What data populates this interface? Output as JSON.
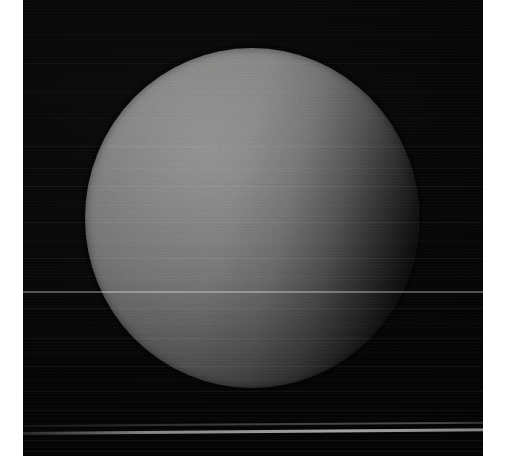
{
  "page": {
    "background_color": "#ffffff",
    "width": 506,
    "height": 476
  },
  "image": {
    "name": "planet-photograph",
    "alt_text": "Grayscale telescope photograph of a featureless planetary disk",
    "plate": {
      "left": 23,
      "top": 0,
      "width": 460,
      "height": 456,
      "background_color": "#050505"
    },
    "margins": {
      "left_px": 23,
      "right_px": 23,
      "top_px": 0,
      "bottom_px": 20,
      "color": "#ffffff"
    }
  },
  "subject": {
    "type": "planetary-disk",
    "description": "Large bright gray sphere, limb-darkened, illuminated from the upper left with the terminator falling off toward the right edge",
    "disk": {
      "center_x": 252,
      "center_y": 218,
      "diameter_px": 338,
      "bounds": {
        "left": 85,
        "top": 48,
        "right": 419,
        "bottom": 388
      }
    },
    "colors": {
      "highlight": "#9a9a99",
      "midtone": "#8a8a89",
      "limb": "#5a5a5b",
      "terminator": "#2a2a2b",
      "sky": "#050505",
      "streak_highlight": "#ffffff"
    }
  },
  "artifacts": {
    "description": "Horizontal detector scan lines and readout streaks across the dark sky",
    "scan_streaks": [
      {
        "top": 12,
        "height": 1,
        "intensity": "dim"
      },
      {
        "top": 34,
        "height": 1,
        "intensity": "dim"
      },
      {
        "top": 63,
        "height": 1,
        "intensity": "dim"
      },
      {
        "top": 92,
        "height": 1,
        "intensity": "dim"
      },
      {
        "top": 118,
        "height": 1,
        "intensity": "dim"
      },
      {
        "top": 146,
        "height": 1,
        "intensity": "normal"
      },
      {
        "top": 168,
        "height": 1,
        "intensity": "dim"
      },
      {
        "top": 186,
        "height": 1,
        "intensity": "normal"
      },
      {
        "top": 205,
        "height": 1,
        "intensity": "dim"
      },
      {
        "top": 222,
        "height": 1,
        "intensity": "normal"
      },
      {
        "top": 241,
        "height": 1,
        "intensity": "dim"
      },
      {
        "top": 258,
        "height": 1,
        "intensity": "normal"
      },
      {
        "top": 276,
        "height": 1,
        "intensity": "dim"
      },
      {
        "top": 291,
        "height": 2,
        "intensity": "bright"
      },
      {
        "top": 308,
        "height": 1,
        "intensity": "normal"
      },
      {
        "top": 323,
        "height": 1,
        "intensity": "dim"
      },
      {
        "top": 338,
        "height": 1,
        "intensity": "normal"
      },
      {
        "top": 352,
        "height": 1,
        "intensity": "dim"
      },
      {
        "top": 366,
        "height": 1,
        "intensity": "normal"
      },
      {
        "top": 379,
        "height": 1,
        "intensity": "dim"
      },
      {
        "top": 391,
        "height": 1,
        "intensity": "normal"
      },
      {
        "top": 401,
        "height": 1,
        "intensity": "dim"
      },
      {
        "top": 410,
        "height": 1,
        "intensity": "normal"
      },
      {
        "top": 418,
        "height": 1,
        "intensity": "dim"
      },
      {
        "top": 440,
        "height": 1,
        "intensity": "normal"
      },
      {
        "top": 446,
        "height": 1,
        "intensity": "dim"
      },
      {
        "top": 451,
        "height": 1,
        "intensity": "normal"
      }
    ],
    "primary_bright_streak": {
      "top": 432,
      "height_px": 3,
      "slope_deg": -0.45,
      "intensity": "very-bright"
    },
    "secondary_bright_streak": {
      "top": 425,
      "height_px": 2,
      "slope_deg": -0.4,
      "intensity": "bright"
    }
  }
}
